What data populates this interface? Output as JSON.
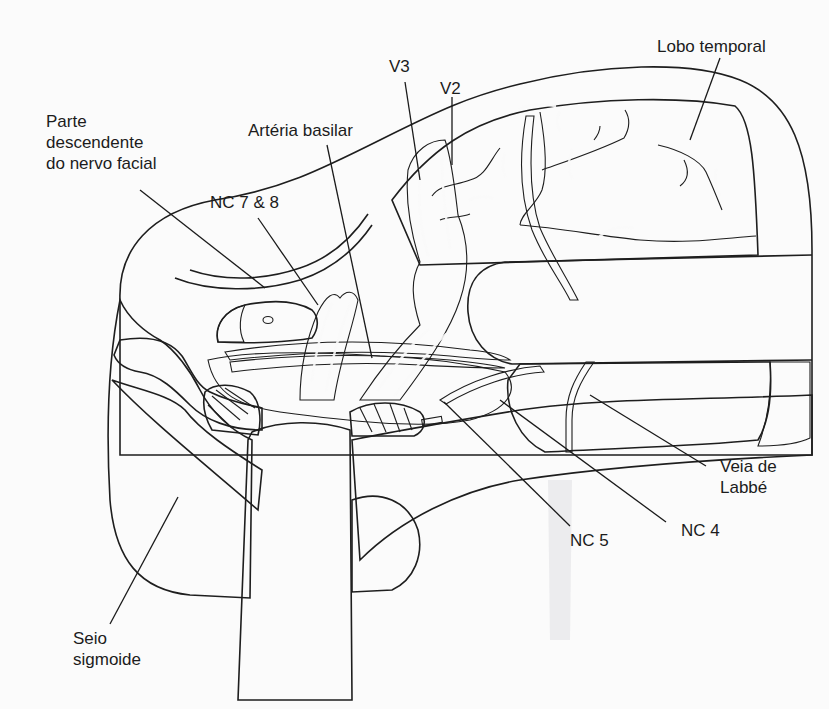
{
  "figure": {
    "colors": {
      "background": "#fbfbfb",
      "retractor_gray": "#bcbcbe",
      "brain_gray": "#8f9092",
      "nerve_light": "#e4e4e6",
      "outline": "#1e1e1e",
      "artery_dark": "#5a4a50"
    }
  },
  "labels": {
    "facial_nerve": "Parte\ndescendente\ndo nervo facial",
    "cn78": "NC 7 & 8",
    "basilar": "Artéria basilar",
    "v3": "V3",
    "v2": "V2",
    "temporal_lobe": "Lobo temporal",
    "labbe": "Veia de\nLabbé",
    "cn4": "NC 4",
    "cn5": "NC 5",
    "sigmoid": "Seio\nsigmoide"
  }
}
